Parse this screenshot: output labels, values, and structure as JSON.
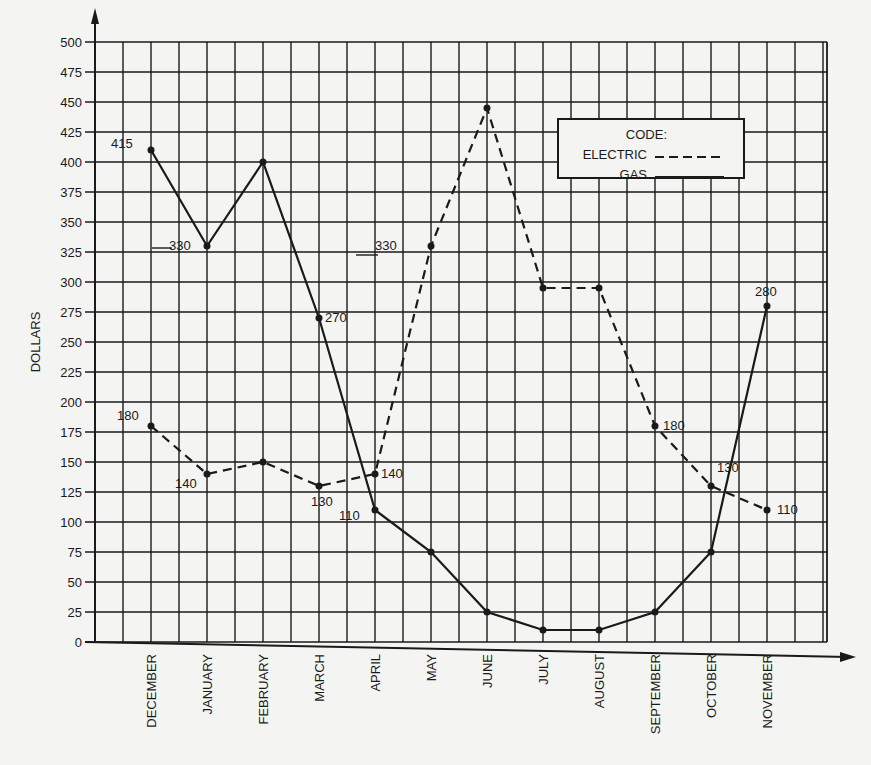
{
  "chart_data": {
    "type": "line",
    "title": "",
    "xlabel": "",
    "ylabel": "DOLLARS",
    "ylim": [
      0,
      500
    ],
    "ytick_step": 25,
    "grid": true,
    "legend_position": "upper right",
    "legend_title": "CODE:",
    "categories": [
      "DECEMBER",
      "JANUARY",
      "FEBRUARY",
      "MARCH",
      "APRIL",
      "MAY",
      "JUNE",
      "JULY",
      "AUGUST",
      "SEPTEMBER",
      "OCTOBER",
      "NOVEMBER"
    ],
    "series": [
      {
        "name": "ELECTRIC",
        "style": "dashed",
        "values": [
          180,
          140,
          150,
          130,
          140,
          330,
          445,
          295,
          295,
          180,
          130,
          110
        ],
        "labels": [
          "180",
          "140",
          "",
          "130",
          "140",
          "330",
          "",
          "",
          "",
          "180",
          "130",
          "110"
        ]
      },
      {
        "name": "GAS",
        "style": "solid",
        "values": [
          410,
          330,
          400,
          270,
          110,
          75,
          25,
          10,
          10,
          25,
          75,
          280
        ],
        "labels": [
          "415",
          "330",
          "",
          "270",
          "110",
          "",
          "",
          "",
          "",
          "",
          "",
          "280"
        ]
      }
    ]
  },
  "ui": {
    "ylabel": "DOLLARS",
    "legend_title": "CODE:",
    "legend_electric": "ELECTRIC",
    "legend_gas": "GAS"
  }
}
